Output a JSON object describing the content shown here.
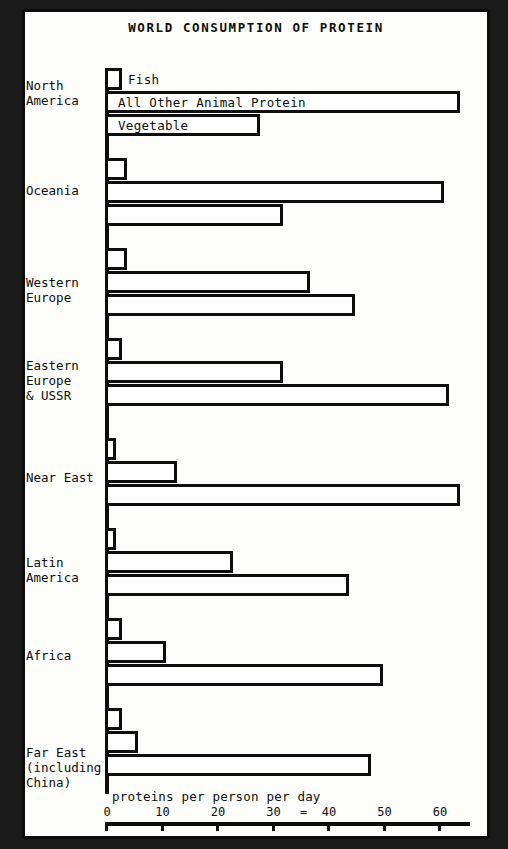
{
  "title": "WORLD CONSUMPTION OF PROTEIN",
  "axis_caption": "proteins per person per day",
  "eq_artifact": "=",
  "series_labels": {
    "fish": "Fish",
    "animal": "All Other Animal Protein",
    "vegetable": "Vegetable"
  },
  "ticks": [
    {
      "label": "0",
      "value": 0
    },
    {
      "label": "10",
      "value": 10
    },
    {
      "label": "20",
      "value": 20
    },
    {
      "label": "30",
      "value": 30
    },
    {
      "label": "40",
      "value": 40
    },
    {
      "label": "50",
      "value": 50
    },
    {
      "label": "60",
      "value": 60
    }
  ],
  "regions": [
    {
      "label": "North\nAmerica"
    },
    {
      "label": "Oceania"
    },
    {
      "label": "Western\nEurope"
    },
    {
      "label": "Eastern\nEurope\n& USSR"
    },
    {
      "label": "Near East"
    },
    {
      "label": "Latin\nAmerica"
    },
    {
      "label": "Africa"
    },
    {
      "label": "Far East\n(including\nChina)"
    }
  ],
  "chart_data": {
    "type": "bar",
    "orientation": "horizontal",
    "title": "WORLD CONSUMPTION OF PROTEIN",
    "xlabel": "proteins per person per day",
    "ylabel": "",
    "xlim": [
      0,
      65
    ],
    "grid": false,
    "legend": "inline-first-group",
    "categories": [
      "North America",
      "Oceania",
      "Western Europe",
      "Eastern Europe & USSR",
      "Near East",
      "Latin America",
      "Africa",
      "Far East (including China)"
    ],
    "series": [
      {
        "name": "Fish",
        "values": [
          3,
          4,
          4,
          3,
          2,
          2,
          3,
          3
        ]
      },
      {
        "name": "All Other Animal Protein",
        "values": [
          64,
          61,
          37,
          32,
          13,
          23,
          11,
          6
        ]
      },
      {
        "name": "Vegetable",
        "values": [
          28,
          32,
          45,
          62,
          64,
          44,
          50,
          48
        ]
      }
    ]
  }
}
